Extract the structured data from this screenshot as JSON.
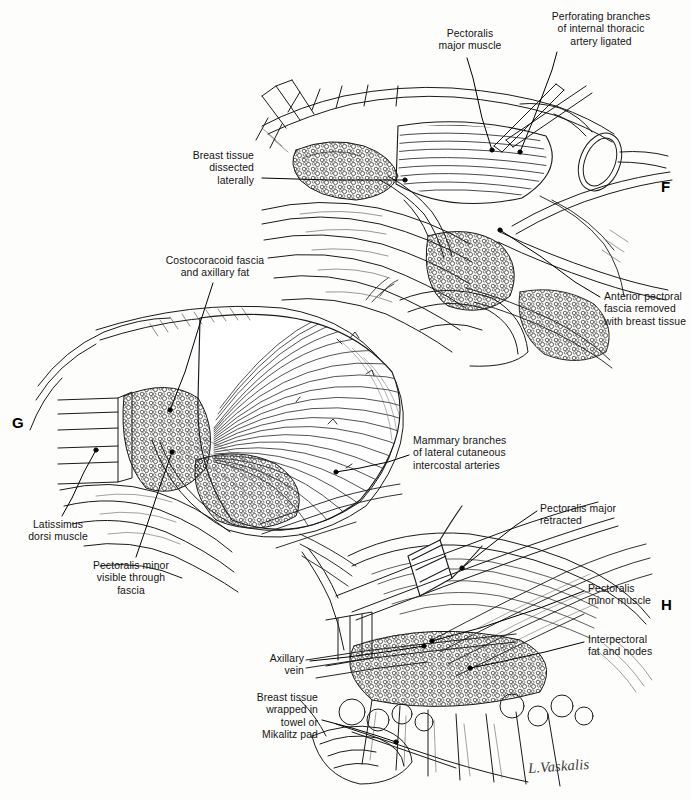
{
  "plate": {
    "title": "Modified radical mastectomy — operative steps F, G, H",
    "background_color": "#fdfdfc",
    "ink_color": "#1a1a1a",
    "signature": "L.Vaskalis"
  },
  "panels": [
    {
      "letter": "F",
      "name": "panel-f",
      "caption": "Breast tissue dissected laterally off pectoralis major; perforating branches of internal thoracic artery ligated"
    },
    {
      "letter": "G",
      "name": "panel-g",
      "caption": "Pectoralis major fanned; costocoracoid fascia and axillary fat exposed"
    },
    {
      "letter": "H",
      "name": "panel-h",
      "caption": "Pectoralis major retracted exposing pectoralis minor and interpectoral fat and nodes"
    }
  ],
  "labels": [
    {
      "id": "pectoralis-major-muscle",
      "text": "Pectoralis\nmajor muscle",
      "panel": "F",
      "align": "center",
      "x": 424,
      "y": 28,
      "w": 92,
      "leader": [
        [
          467,
          58
        ],
        [
          473,
          78
        ],
        [
          482,
          118
        ],
        [
          492,
          150
        ]
      ]
    },
    {
      "id": "perforating-branches",
      "text": "Perforating branches\nof internal thoracic\nartery ligated",
      "panel": "F",
      "align": "center",
      "x": 528,
      "y": 11,
      "w": 146,
      "leader": [
        [
          557,
          52
        ],
        [
          552,
          70
        ],
        [
          534,
          118
        ],
        [
          520,
          152
        ]
      ]
    },
    {
      "id": "breast-tissue-dissected-laterally",
      "text": "Breast tissue\ndissected\nlaterally",
      "panel": "F",
      "align": "right",
      "x": 158,
      "y": 150,
      "w": 96,
      "leader": [
        [
          262,
          178
        ],
        [
          330,
          180
        ],
        [
          405,
          180
        ]
      ]
    },
    {
      "id": "anterior-pectoral-fascia",
      "text": "Anterior pectoral\nfascia removed\nwith breast tissue",
      "panel": "F",
      "align": "left",
      "x": 604,
      "y": 291,
      "w": 110,
      "leader": [
        [
          600,
          297
        ],
        [
          575,
          282
        ],
        [
          540,
          256
        ],
        [
          500,
          230
        ]
      ]
    },
    {
      "id": "costocoracoid-fascia",
      "text": "Costocoracoid fascia\nand axillary fat",
      "panel": "G",
      "align": "center",
      "x": 150,
      "y": 255,
      "w": 130,
      "leader": [
        [
          213,
          283
        ],
        [
          201,
          320
        ],
        [
          185,
          372
        ],
        [
          170,
          410
        ]
      ]
    },
    {
      "id": "mammary-branches",
      "text": "Mammary branches\nof lateral cutaneous\nintercostal arteries",
      "panel": "G",
      "align": "left",
      "x": 413,
      "y": 435,
      "w": 118,
      "leader": [
        [
          409,
          455
        ],
        [
          388,
          462
        ],
        [
          360,
          468
        ],
        [
          336,
          472
        ]
      ]
    },
    {
      "id": "latissimus-dorsi-muscle",
      "text": "Latissimus\ndorsi muscle",
      "panel": "G",
      "align": "center",
      "x": 18,
      "y": 519,
      "w": 80,
      "leader": [
        [
          62,
          516
        ],
        [
          72,
          498
        ],
        [
          84,
          472
        ],
        [
          96,
          450
        ]
      ]
    },
    {
      "id": "pectoralis-minor-visible",
      "text": "Pectoralis minor\nvisible through\nfascia",
      "panel": "G",
      "align": "center",
      "x": 77,
      "y": 560,
      "w": 108,
      "leader": [
        [
          136,
          557
        ],
        [
          146,
          528
        ],
        [
          160,
          486
        ],
        [
          172,
          452
        ]
      ]
    },
    {
      "id": "pectoralis-major-retracted",
      "text": "Pectoralis major\nretracted",
      "panel": "H",
      "align": "left",
      "x": 540,
      "y": 503,
      "w": 106,
      "leader": [
        [
          537,
          511
        ],
        [
          515,
          526
        ],
        [
          487,
          548
        ],
        [
          462,
          568
        ]
      ]
    },
    {
      "id": "pectoralis-minor-muscle",
      "text": "Pectoralis\nminor muscle",
      "panel": "H",
      "align": "left",
      "x": 588,
      "y": 583,
      "w": 88,
      "leader": [
        [
          584,
          591
        ],
        [
          540,
          608
        ],
        [
          480,
          628
        ],
        [
          432,
          641
        ]
      ]
    },
    {
      "id": "interpectoral-fat-and-nodes",
      "text": "Interpectoral\nfat and nodes",
      "panel": "H",
      "align": "left",
      "x": 588,
      "y": 634,
      "w": 90,
      "leader": [
        [
          584,
          642
        ],
        [
          545,
          652
        ],
        [
          500,
          662
        ],
        [
          470,
          668
        ]
      ]
    },
    {
      "id": "axillary-vein",
      "text": "Axillary\nvein",
      "panel": "H",
      "align": "right",
      "x": 236,
      "y": 653,
      "w": 68,
      "leader": [
        [
          310,
          661
        ],
        [
          348,
          657
        ],
        [
          392,
          651
        ],
        [
          424,
          646
        ]
      ]
    },
    {
      "id": "breast-tissue-wrapped",
      "text": "Breast tissue\nwrapped in\ntowel or\nMikalitz pad",
      "panel": "H",
      "align": "right",
      "x": 224,
      "y": 692,
      "w": 94,
      "leader": [
        [
          322,
          720
        ],
        [
          352,
          728
        ],
        [
          378,
          736
        ],
        [
          396,
          742
        ]
      ]
    }
  ]
}
